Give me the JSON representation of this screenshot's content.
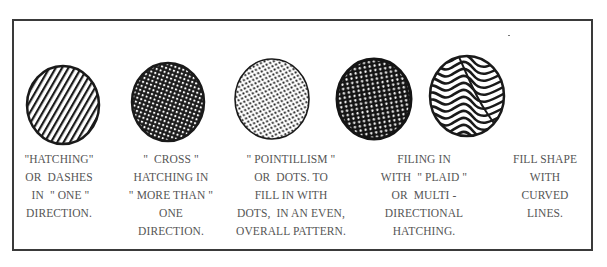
{
  "figure": {
    "colors": {
      "ink": "#1a1a1a",
      "text": "#555555",
      "frame": "#3a3a3a",
      "paper": "#ffffff"
    },
    "techniques": [
      {
        "id": "hatching",
        "icon": "hatching-circle-icon",
        "caption": "\"HATCHING\"\nOR  DASHES\n IN  \" ONE \"\nDIRECTION."
      },
      {
        "id": "cross-hatching",
        "icon": "cross-hatching-circle-icon",
        "caption": "\"  CROSS \"\nHATCHING IN\n\" MORE THAN \"\nONE\nDIRECTION."
      },
      {
        "id": "pointillism",
        "icon": "pointillism-circle-icon",
        "caption": "\" POINTILLISM \"\nOR  DOTS. TO\nFILL IN WITH\nDOTS,  IN AN EVEN,\nOVERALL PATTERN."
      },
      {
        "id": "plaid",
        "icon": "plaid-hatching-circle-icon",
        "caption": "FILING IN\nWITH  \" PLAID \"\nOR  MULTI -\nDIRECTIONAL\nHATCHING."
      },
      {
        "id": "curved-lines",
        "icon": "curved-lines-circle-icon",
        "caption": "FILL SHAPE\nWITH\nCURVED\nLINES."
      }
    ]
  }
}
